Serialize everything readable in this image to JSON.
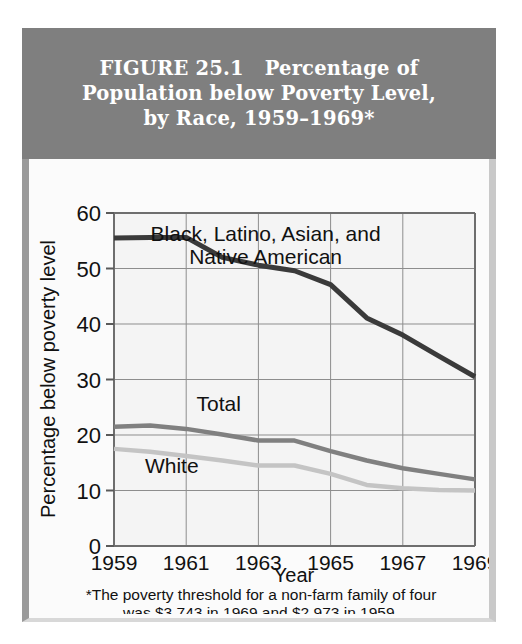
{
  "figure": {
    "title_lines": [
      "FIGURE 25.1   Percentage of",
      "Population below Poverty Level,",
      "by Race, 1959–1969*"
    ],
    "footnote_lines": [
      "*The poverty threshold for a non-farm family of four",
      "was  $3,743 in 1969 and $2,973 in 1959."
    ],
    "colors": {
      "title_band": "#7f7f7f",
      "title_text": "#ffffff",
      "plot_background": "#f4f4f4",
      "grid": "#8d8d8d",
      "series_minority": "#3a3a3a",
      "series_total": "#808080",
      "series_white": "#c4c4c4"
    }
  },
  "chart_data": {
    "type": "line",
    "title": "FIGURE 25.1   Percentage of Population below Poverty Level, by Race, 1959–1969*",
    "xlabel": "Year",
    "ylabel": "Percentage below poverty level",
    "xlim": [
      1959,
      1969
    ],
    "ylim": [
      0,
      60
    ],
    "yticks": [
      0,
      10,
      20,
      30,
      40,
      50,
      60
    ],
    "xticks": [
      1959,
      1961,
      1963,
      1965,
      1967,
      1969
    ],
    "grid": true,
    "legend_position": "inline-annotations",
    "x": [
      1959,
      1960,
      1961,
      1962,
      1963,
      1964,
      1965,
      1966,
      1967,
      1968,
      1969
    ],
    "series": [
      {
        "name": "Black, Latino, Asian, and Native American",
        "color": "#3a3a3a",
        "values": [
          55.5,
          55.6,
          55.6,
          52.0,
          50.6,
          49.6,
          47.1,
          41.1,
          38.0,
          34.2,
          30.5
        ]
      },
      {
        "name": "Total",
        "color": "#808080",
        "values": [
          21.5,
          21.7,
          21.1,
          20.1,
          19.0,
          19.0,
          17.1,
          15.4,
          14.0,
          13.0,
          12.0
        ]
      },
      {
        "name": "White",
        "color": "#c4c4c4",
        "values": [
          17.5,
          17.0,
          16.2,
          15.4,
          14.5,
          14.5,
          13.0,
          11.0,
          10.4,
          10.1,
          10.0
        ]
      }
    ],
    "annotations": [
      {
        "text_lines": [
          "Black, Latino, Asian, and",
          "Native American"
        ],
        "x": 1963.2,
        "y": 55.0
      },
      {
        "text_lines": [
          "Total"
        ],
        "x": 1961.9,
        "y": 24.3
      },
      {
        "text_lines": [
          "White"
        ],
        "x": 1960.6,
        "y": 13.2
      }
    ]
  }
}
